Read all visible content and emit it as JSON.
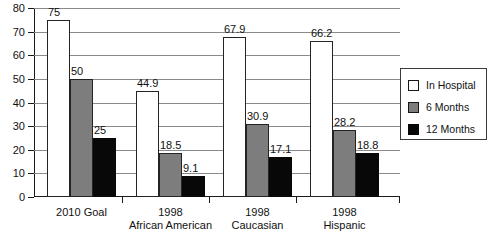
{
  "chart_data": {
    "type": "bar",
    "title": "",
    "xlabel": "",
    "ylabel": "",
    "ylim": [
      0,
      80
    ],
    "ytick_step": 10,
    "yticks": [
      "0",
      "10",
      "20",
      "30",
      "40",
      "50",
      "60",
      "70",
      "80"
    ],
    "grid": true,
    "legend_position": "top-right-inside",
    "categories": [
      "2010 Goal",
      "1998 African American",
      "1998 Caucasian",
      "1998 Hispanic"
    ],
    "category_lines": [
      [
        "2010 Goal",
        ""
      ],
      [
        "1998",
        "African American"
      ],
      [
        "1998",
        "Caucasian"
      ],
      [
        "1998",
        "Hispanic"
      ]
    ],
    "series": [
      {
        "name": "In Hospital",
        "color": "#ffffff",
        "values": [
          75,
          44.9,
          67.9,
          66.2
        ],
        "labels": [
          "75",
          "44.9",
          "67.9",
          "66.2"
        ]
      },
      {
        "name": "6 Months",
        "color": "#7d7d7d",
        "values": [
          50,
          18.5,
          30.9,
          28.2
        ],
        "labels": [
          "50",
          "18.5",
          "30.9",
          "28.2"
        ]
      },
      {
        "name": "12 Months",
        "color": "#080808",
        "values": [
          25,
          9.1,
          17.1,
          18.8
        ],
        "labels": [
          "25",
          "9.1",
          "17.1",
          "18.8"
        ]
      }
    ]
  },
  "legend": {
    "items": [
      {
        "label": "In Hospital",
        "swatch": "white-square-icon"
      },
      {
        "label": "6 Months",
        "swatch": "gray-square-icon"
      },
      {
        "label": "12 Months",
        "swatch": "black-square-icon"
      }
    ]
  }
}
